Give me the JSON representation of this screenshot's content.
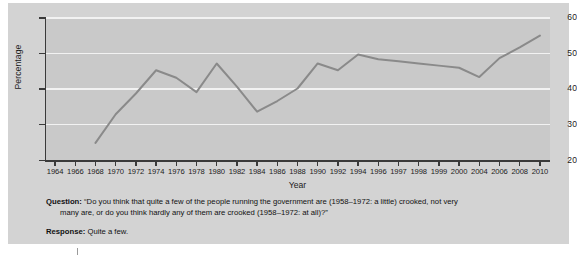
{
  "chart_data": {
    "type": "line",
    "title": "",
    "xlabel": "Year",
    "ylabel": "Percentage",
    "ylim": [
      20,
      60
    ],
    "yticks": [
      20,
      30,
      40,
      50,
      60
    ],
    "grid": "horizontal-white-gridlines",
    "legend": "none",
    "xticks": [
      "1964",
      "1966",
      "1968",
      "1970",
      "1972",
      "1974",
      "1976",
      "1978",
      "1980",
      "1982",
      "1984",
      "1986",
      "1988",
      "1990",
      "1992",
      "1994",
      "1996",
      "1997",
      "1998",
      "1999",
      "2000",
      "2004",
      "2006",
      "2008",
      "2010"
    ],
    "series": [
      {
        "name": "Quite a few",
        "color": "#8a8a8a",
        "x": [
          1968,
          1970,
          1972,
          1974,
          1976,
          1978,
          1980,
          1982,
          1984,
          1986,
          1988,
          1990,
          1992,
          1994,
          1996,
          1997,
          1998,
          1999,
          2000,
          2004,
          2006,
          2008,
          2010
        ],
        "values": [
          24.8,
          32.8,
          38.6,
          45.1,
          43.0,
          39.0,
          47.0,
          40.5,
          33.5,
          36.5,
          40.0,
          47.0,
          45.1,
          49.5,
          48.2,
          47.6,
          47.0,
          46.4,
          45.8,
          43.2,
          48.5,
          51.5,
          54.8
        ]
      }
    ]
  },
  "caption": {
    "question_label": "Question:",
    "question_line1": "“Do you think that quite a few of the people running the government are (1958–1972: a little) crooked, not very",
    "question_line2": "many are, or do you think hardly any of them are crooked (1958–1972: at all)?”",
    "response_label": "Response:",
    "response_text": "Quite a few."
  },
  "colors": {
    "figure_background": "#d3d3d3",
    "plot_background": "#c9c9c9",
    "line": "#8a8a8a",
    "gridline": "#f2f2f2",
    "axis": "#3a3a3a",
    "text": "#111111"
  }
}
